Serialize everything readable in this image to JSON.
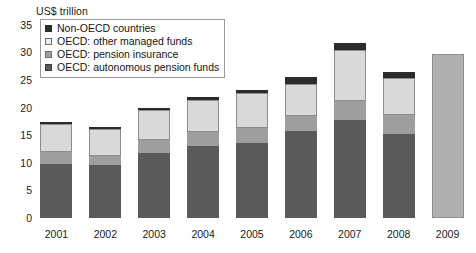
{
  "chart_data": {
    "type": "bar",
    "subtype": "stacked-bar",
    "title": "",
    "axis_unit_label": "US$ trillion",
    "xlabel": "",
    "ylabel": "US$ trillion",
    "ylim": [
      0,
      35
    ],
    "y_ticks": [
      0,
      5,
      10,
      15,
      20,
      25,
      30,
      35
    ],
    "grid": false,
    "legend_position": "top-left-inside",
    "categories": [
      "2001",
      "2002",
      "2003",
      "2004",
      "2005",
      "2006",
      "2007",
      "2008",
      "2009"
    ],
    "series": [
      {
        "name": "OECD: autonomous pension funds",
        "color": "#5a5a5a",
        "values": [
          9.8,
          9.6,
          11.8,
          13.0,
          13.6,
          15.8,
          17.7,
          15.2,
          null
        ]
      },
      {
        "name": "OECD: pension insurance",
        "color": "#9e9e9e",
        "values": [
          2.2,
          1.6,
          2.3,
          2.6,
          2.7,
          2.6,
          3.4,
          3.5,
          null
        ]
      },
      {
        "name": "OECD: other managed funds",
        "color": "#d9d9d9",
        "values": [
          5.1,
          4.9,
          5.4,
          5.8,
          6.3,
          5.9,
          9.3,
          6.7,
          null
        ]
      },
      {
        "name": "Non-OECD countries",
        "color": "#2b2b2b",
        "values": [
          0.2,
          0.4,
          0.4,
          0.5,
          0.6,
          1.3,
          1.2,
          1.1,
          null
        ]
      },
      {
        "name": "2009 total (unsegmented)",
        "color": "#b0b0b0",
        "values": [
          null,
          null,
          null,
          null,
          null,
          null,
          null,
          null,
          29.7
        ]
      }
    ],
    "totals": [
      17.3,
      16.5,
      19.9,
      21.9,
      23.2,
      25.6,
      31.6,
      26.5,
      29.7
    ],
    "annotations": []
  },
  "legend": {
    "items": [
      {
        "label": "Non-OECD countries",
        "swatch": "#2b2b2b",
        "border": "#2b2b2b"
      },
      {
        "label": "OECD: other managed funds",
        "swatch": "#ededed",
        "border": "#6f6f6f"
      },
      {
        "label": "OECD: pension insurance",
        "swatch": "#9e9e9e",
        "border": "#6f6f6f"
      },
      {
        "label": "OECD: autonomous pension funds",
        "swatch": "#5a5a5a",
        "border": "#3a3a3a"
      }
    ]
  },
  "colors": {
    "non_oecd": "#2b2b2b",
    "other_managed": "#d9d9d9",
    "pension_insurance": "#9e9e9e",
    "autonomous": "#5a5a5a",
    "year_2009": "#b0b0b0",
    "text": "#1a1a1a",
    "background": "#ffffff"
  }
}
